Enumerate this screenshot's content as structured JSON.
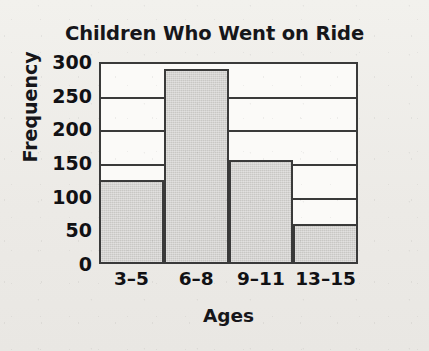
{
  "chart_data": {
    "type": "bar",
    "title": "Children Who Went on Ride",
    "xlabel": "Ages",
    "ylabel": "Frequency",
    "categories": [
      "3–5",
      "6–8",
      "9–11",
      "13–15"
    ],
    "values": [
      125,
      290,
      155,
      60
    ],
    "ylim": [
      0,
      300
    ],
    "ytick_labels": [
      "300",
      "250",
      "200",
      "150",
      "100",
      "50",
      "0"
    ],
    "ytick_values": [
      300,
      250,
      200,
      150,
      100,
      50,
      0
    ],
    "grid": true,
    "grid_axis": "y",
    "legend": false,
    "legend_position": "none",
    "bar_fill_color": "#c8c7c4",
    "bar_edge_color": "#3a3a3a",
    "axis_color": "#3a3a3a",
    "plot_background_color": "#fbfaf8",
    "page_background_color": "#efeeea",
    "text_color": "#16161a",
    "bars_contiguous": true
  }
}
